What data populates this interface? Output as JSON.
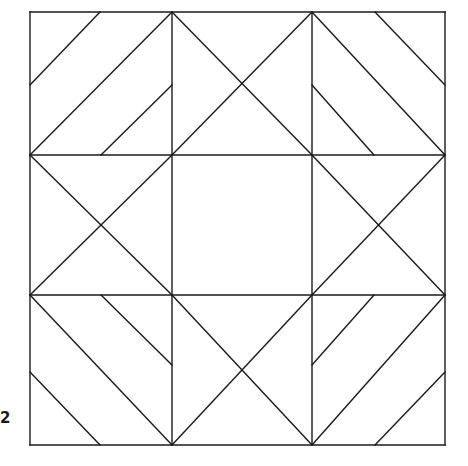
{
  "figure": {
    "label": "2",
    "kind": "geometric-pattern",
    "background_color": "#ffffff",
    "stroke_color": "#1a1a1a",
    "stroke_width": 1.4,
    "fill": "none",
    "canvas": {
      "width": 468,
      "height": 466
    }
  },
  "geometry": {
    "outer_square": {
      "left": 30,
      "top": 12,
      "right": 445,
      "bottom": 445
    },
    "grid_x": [
      30,
      172,
      312,
      445
    ],
    "grid_y": [
      12,
      155,
      295,
      445
    ],
    "center_square": {
      "left": 172,
      "top": 155,
      "right": 312,
      "bottom": 295
    },
    "description": "Three-by-three grid. Four edge-middle cells each carry both diagonals forming an X. The centre cell is empty. The four corner cells carry parallel forty-five degree stripes arranged as a pinwheel."
  },
  "segments": {
    "frame": [
      {
        "name": "outer-top",
        "x1": 30,
        "y1": 12,
        "x2": 445,
        "y2": 12
      },
      {
        "name": "outer-right",
        "x1": 445,
        "y1": 12,
        "x2": 445,
        "y2": 445
      },
      {
        "name": "outer-bottom",
        "x1": 30,
        "y1": 445,
        "x2": 445,
        "y2": 445
      },
      {
        "name": "outer-left",
        "x1": 30,
        "y1": 12,
        "x2": 30,
        "y2": 445
      }
    ],
    "grid": [
      {
        "name": "vertical-left",
        "x1": 172,
        "y1": 12,
        "x2": 172,
        "y2": 445
      },
      {
        "name": "vertical-right",
        "x1": 312,
        "y1": 12,
        "x2": 312,
        "y2": 445
      },
      {
        "name": "horizontal-upper",
        "x1": 30,
        "y1": 155,
        "x2": 445,
        "y2": 155
      },
      {
        "name": "horizontal-lower",
        "x1": 30,
        "y1": 295,
        "x2": 445,
        "y2": 295
      }
    ],
    "edge_cell_crosses": [
      {
        "name": "top-middle-cell-diag-a",
        "x1": 172,
        "y1": 12,
        "x2": 312,
        "y2": 155
      },
      {
        "name": "top-middle-cell-diag-b",
        "x1": 312,
        "y1": 12,
        "x2": 172,
        "y2": 155
      },
      {
        "name": "left-middle-cell-diag-a",
        "x1": 30,
        "y1": 155,
        "x2": 172,
        "y2": 295
      },
      {
        "name": "left-middle-cell-diag-b",
        "x1": 172,
        "y1": 155,
        "x2": 30,
        "y2": 295
      },
      {
        "name": "right-middle-cell-diag-a",
        "x1": 312,
        "y1": 155,
        "x2": 445,
        "y2": 295
      },
      {
        "name": "right-middle-cell-diag-b",
        "x1": 445,
        "y1": 155,
        "x2": 312,
        "y2": 295
      },
      {
        "name": "bottom-middle-cell-diag-a",
        "x1": 172,
        "y1": 295,
        "x2": 312,
        "y2": 445
      },
      {
        "name": "bottom-middle-cell-diag-b",
        "x1": 312,
        "y1": 295,
        "x2": 172,
        "y2": 445
      }
    ],
    "corner_stripes": [
      {
        "name": "top-left-stripe-outer",
        "x1": 30,
        "y1": 85,
        "x2": 100,
        "y2": 12
      },
      {
        "name": "top-left-stripe-main",
        "x1": 30,
        "y1": 155,
        "x2": 172,
        "y2": 12
      },
      {
        "name": "top-left-stripe-inner",
        "x1": 101,
        "y1": 155,
        "x2": 172,
        "y2": 85
      },
      {
        "name": "top-right-stripe-outer",
        "x1": 445,
        "y1": 85,
        "x2": 375,
        "y2": 12
      },
      {
        "name": "top-right-stripe-main",
        "x1": 445,
        "y1": 155,
        "x2": 312,
        "y2": 12
      },
      {
        "name": "top-right-stripe-inner",
        "x1": 374,
        "y1": 155,
        "x2": 312,
        "y2": 85
      },
      {
        "name": "bottom-left-stripe-outer",
        "x1": 30,
        "y1": 372,
        "x2": 100,
        "y2": 445
      },
      {
        "name": "bottom-left-stripe-main",
        "x1": 30,
        "y1": 295,
        "x2": 172,
        "y2": 445
      },
      {
        "name": "bottom-left-stripe-inner",
        "x1": 101,
        "y1": 295,
        "x2": 172,
        "y2": 365
      },
      {
        "name": "bottom-right-stripe-outer",
        "x1": 445,
        "y1": 372,
        "x2": 375,
        "y2": 445
      },
      {
        "name": "bottom-right-stripe-main",
        "x1": 445,
        "y1": 295,
        "x2": 312,
        "y2": 445
      },
      {
        "name": "bottom-right-stripe-inner",
        "x1": 374,
        "y1": 295,
        "x2": 312,
        "y2": 365
      }
    ]
  }
}
